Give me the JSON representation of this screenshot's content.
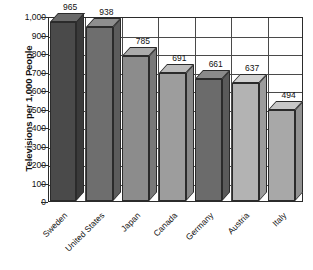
{
  "chart_data": {
    "type": "bar",
    "title": "",
    "xlabel": "",
    "ylabel": "Televisions per 1,000 People",
    "ylim": [
      0,
      1000
    ],
    "grid": true,
    "legend": "none",
    "categories": [
      "Sweden",
      "United States",
      "Japan",
      "Canada",
      "Germany",
      "Austria",
      "Italy"
    ],
    "values": [
      965,
      938,
      785,
      691,
      661,
      637,
      494
    ],
    "value_labels": [
      "965",
      "938",
      "785",
      "691",
      "661",
      "637",
      "494"
    ],
    "ytick_labels": [
      "1,000",
      "900",
      "800",
      "700",
      "600",
      "500",
      "400",
      "300",
      "200",
      "100",
      "0"
    ],
    "ytick_values": [
      1000,
      900,
      800,
      700,
      600,
      500,
      400,
      300,
      200,
      100,
      0
    ],
    "bar_colors": [
      "#4a4a4a",
      "#6e6e6e",
      "#8c8c8c",
      "#9d9d9d",
      "#6b6b6b",
      "#b3b3b3",
      "#a8a8a8"
    ],
    "bar_top_colors": [
      "#6a6a6a",
      "#8e8e8e",
      "#ababab",
      "#bcbcbc",
      "#8a8a8a",
      "#d2d2d2",
      "#c7c7c7"
    ],
    "bar_side_colors": [
      "#3a3a3a",
      "#5c5c5c",
      "#787878",
      "#888888",
      "#5a5a5a",
      "#9c9c9c",
      "#929292"
    ],
    "axis_color": "#2b2b2b",
    "grid_color": "#4a4a4a",
    "background_color": "#ffffff"
  }
}
